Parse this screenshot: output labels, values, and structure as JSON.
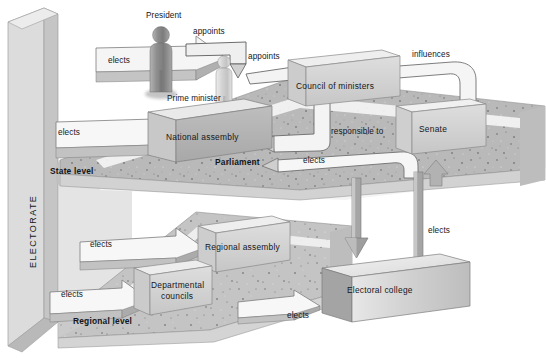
{
  "diagram": {
    "electorate_label": "ELECTORATE",
    "levels": {
      "state": "State level",
      "regional": "Regional level"
    },
    "actors": [
      {
        "id": "president",
        "label": "President",
        "kind": "figure"
      },
      {
        "id": "prime-minister",
        "label": "Prime minister",
        "kind": "figure"
      }
    ],
    "institutions": [
      {
        "id": "national-assembly",
        "label": "National  assembly"
      },
      {
        "id": "council-of-ministers",
        "label": "Council of ministers"
      },
      {
        "id": "senate",
        "label": "Senate"
      },
      {
        "id": "parliament",
        "label": "Parliament"
      },
      {
        "id": "regional-assembly",
        "label": "Regional  assembly"
      },
      {
        "id": "departmental-councils",
        "label": "Departmental\ncouncils"
      },
      {
        "id": "departmental-councils-line1",
        "label": "Departmental"
      },
      {
        "id": "departmental-councils-line2",
        "label": "councils"
      },
      {
        "id": "electoral-college",
        "label": "Electoral  college"
      }
    ],
    "relations": [
      {
        "id": "elects-president",
        "label": "elects"
      },
      {
        "id": "appoints-pm",
        "label": "appoints"
      },
      {
        "id": "appoints-council",
        "label": "appoints"
      },
      {
        "id": "influences-senate",
        "label": "influences"
      },
      {
        "id": "elects-assembly",
        "label": "elects"
      },
      {
        "id": "responsible-to",
        "label": "responsible  to"
      },
      {
        "id": "elects-senate",
        "label": "elects"
      },
      {
        "id": "elects-regional-assembly",
        "label": "elects"
      },
      {
        "id": "elects-departmental-councils",
        "label": "elects"
      },
      {
        "id": "elects-electoral-college-left",
        "label": "elects"
      },
      {
        "id": "elects-electoral-college-right",
        "label": "elects"
      }
    ],
    "colors": {
      "background": "#ffffff",
      "ground_light": "#cfcfcf",
      "ground_speckle": "#b6b6b6",
      "panel_light": "#dcdcdc",
      "panel_mid": "#c2c2c2",
      "box_light": "#e2e2e2",
      "box_mid": "#b3b3b3",
      "box_dark": "#9a9a9a",
      "figure_dark": "#9b9b9b",
      "figure_light": "#d6d6d6",
      "arrow_fill": "#f2f2f2",
      "arrow_dark": "#a9a9a9",
      "text": "#14161a"
    }
  }
}
